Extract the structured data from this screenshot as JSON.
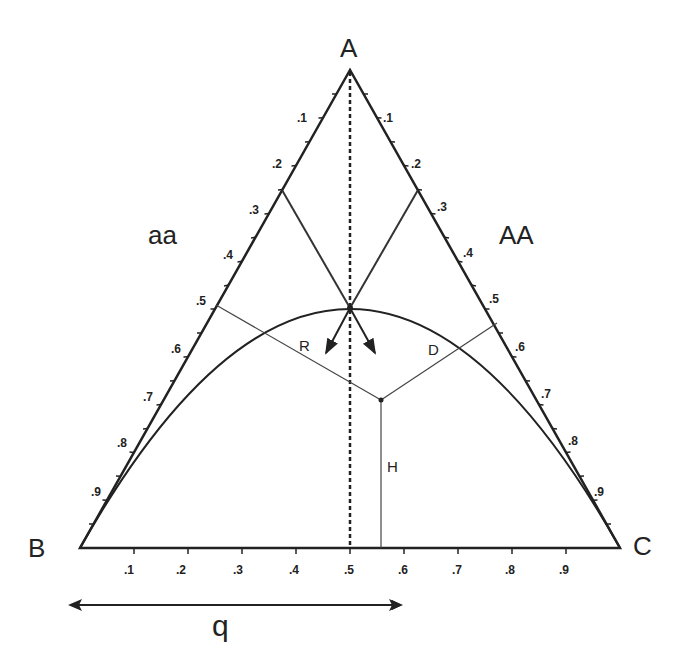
{
  "diagram": {
    "vertices": {
      "top": "A",
      "left": "B",
      "right": "C"
    },
    "regions": {
      "left": "aa",
      "right": "AA"
    },
    "left_ticks": [
      ".1",
      ".2",
      ".3",
      ".4",
      ".5",
      ".6",
      ".7",
      ".8",
      ".9"
    ],
    "right_ticks": [
      ".1",
      ".2",
      ".3",
      ".4",
      ".5",
      ".6",
      ".7",
      ".8",
      ".9"
    ],
    "bottom_ticks": [
      ".1",
      ".2",
      ".3",
      ".4",
      ".5",
      ".6",
      ".7",
      ".8",
      ".9"
    ],
    "distance_labels": {
      "r": "R",
      "d": "D",
      "h": "H"
    },
    "axis_label": "q",
    "curve": "Hardy-Weinberg parabola"
  }
}
